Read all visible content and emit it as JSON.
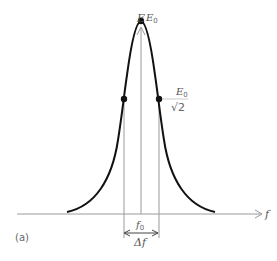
{
  "figure": {
    "panel_label": "(a)",
    "axes": {
      "y_label": "E",
      "x_label": "f"
    },
    "annotations": {
      "peak_label": "E",
      "peak_label_sub": "0",
      "half_point_numerator": "E",
      "half_point_numerator_sub": "0",
      "half_point_denominator": "√2",
      "center_freq": "f",
      "center_freq_sub": "0",
      "bandwidth": "Δf"
    },
    "colors": {
      "curve": "#111111",
      "axis": "#999999",
      "text": "#555555"
    }
  }
}
